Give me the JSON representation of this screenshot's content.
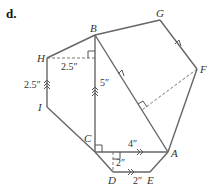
{
  "figure": {
    "label": "d.",
    "vertices": {
      "A": "A",
      "B": "B",
      "C": "C",
      "D": "D",
      "E": "E",
      "F": "F",
      "G": "G",
      "H": "H",
      "I": "I"
    },
    "measurements": {
      "HI": "2.5″",
      "H_to_BC": "2.5″",
      "BC": "5″",
      "CA": "4″",
      "trapezoid_height": "2″",
      "DE": "2″"
    },
    "shapes": [
      {
        "name": "trapezoid BHIC",
        "note": "HI parallel BC"
      },
      {
        "name": "right triangle ABC",
        "note": "right angle at C"
      },
      {
        "name": "parallelogram ABGF",
        "note": "BA parallel GF"
      },
      {
        "name": "trapezoid CDEA",
        "note": "CA parallel DE"
      }
    ],
    "colors": {
      "stroke": "#666666",
      "text": "#333333"
    }
  }
}
